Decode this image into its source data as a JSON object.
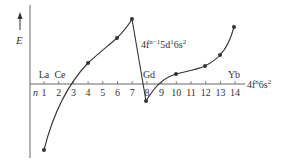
{
  "diagram": {
    "y_axis_label": "E",
    "x_axis_prefix": "n",
    "x_ticks": [
      "1",
      "2",
      "3",
      "4",
      "5",
      "6",
      "7",
      "8",
      "9",
      "10",
      "11",
      "12",
      "13",
      "14"
    ],
    "element_labels": [
      {
        "text": "La",
        "x": 44
      },
      {
        "text": "Ce",
        "x": 60
      },
      {
        "text": "Gd",
        "x": 149
      },
      {
        "text": "Yb",
        "x": 234
      }
    ],
    "config_label_1": {
      "base": "4f",
      "sup1": "n−1",
      "mid": "5d",
      "sup2": "1",
      "tail": "6s",
      "sup3": "2"
    },
    "config_label_2": {
      "base": "4f",
      "sup1": "n",
      "tail": "6s",
      "sup2": "2"
    },
    "curve_1_points": [
      {
        "n": 1,
        "x": 44,
        "y": 150
      },
      {
        "n": 4,
        "x": 88,
        "y": 63
      },
      {
        "n": 6,
        "x": 117,
        "y": 38
      },
      {
        "n": 7,
        "x": 132,
        "y": 19
      }
    ],
    "curve_2_points": [
      {
        "n": 8,
        "x": 146,
        "y": 101
      },
      {
        "n": 10,
        "x": 176,
        "y": 74
      },
      {
        "n": 12,
        "x": 205,
        "y": 66
      },
      {
        "n": 13,
        "x": 220,
        "y": 55
      },
      {
        "n": 14,
        "x": 234,
        "y": 27
      }
    ],
    "colors": {
      "line": "#333333",
      "axis": "#555555"
    }
  }
}
